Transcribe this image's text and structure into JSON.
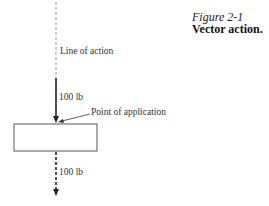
{
  "caption": {
    "figure_number": "Figure 2-1",
    "title": "Vector action."
  },
  "diagram": {
    "line_of_action_label": "Line of action",
    "applied_force_label": "100 lb",
    "point_label": "Point of application",
    "resultant_force_label": "100 lb",
    "colors": {
      "line": "#222222",
      "dashed_guide": "#999999",
      "box_stroke": "#444444"
    }
  }
}
